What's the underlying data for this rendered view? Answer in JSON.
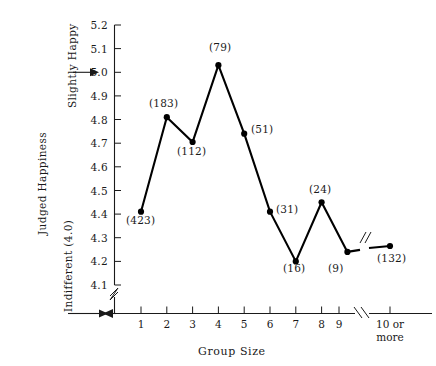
{
  "chart_data": {
    "type": "line",
    "title": "",
    "xlabel": "Group Size",
    "ylabel": "Judged Happiness",
    "categories": [
      "1",
      "2",
      "3",
      "4",
      "5",
      "6",
      "7",
      "8",
      "9",
      "10 or\nmore"
    ],
    "x_tick_labels": [
      "1",
      "2",
      "3",
      "4",
      "5",
      "6",
      "7",
      "8",
      "9",
      "10 or more"
    ],
    "x_tick_label_last_line1": "10 or",
    "x_tick_label_last_line2": "more",
    "values": [
      4.41,
      4.81,
      4.705,
      5.03,
      4.74,
      4.41,
      4.2,
      4.45,
      4.24,
      4.265
    ],
    "point_labels": [
      "(423)",
      "(183)",
      "(112)",
      "(79)",
      "(51)",
      "(31)",
      "(16)",
      "(24)",
      "(9)",
      "(132)"
    ],
    "y_tick_labels": [
      "5.2",
      "5.1",
      "5.0",
      "4.9",
      "4.8",
      "4.7",
      "4.6",
      "4.5",
      "4.4",
      "4.3",
      "4.2",
      "4.1"
    ],
    "y_tick_values": [
      5.2,
      5.1,
      5.0,
      4.9,
      4.8,
      4.7,
      4.6,
      4.5,
      4.4,
      4.3,
      4.2,
      4.1
    ],
    "ylim": [
      4.1,
      5.2
    ],
    "y_axis_break": true,
    "x_axis_break": true,
    "x_axis_break_between": [
      "9",
      "10 or more"
    ],
    "line_break_between": [
      "9",
      "10 or more"
    ],
    "grid": false,
    "legend": "none",
    "marker": "filled-circle",
    "line_color": "#000000",
    "annotations": [
      {
        "name": "slightly-happy",
        "text": "Slightly Happy",
        "points_to_y": 5.0,
        "orientation": "vertical"
      },
      {
        "name": "indifferent",
        "text": "Indifferent (4.0)",
        "points_to_y": 4.0,
        "orientation": "vertical"
      }
    ]
  },
  "axes": {
    "y_title": "Judged Happiness",
    "x_title": "Group Size",
    "y_upper_anchor_label": "Slightly Happy",
    "y_lower_anchor_label": "Indifferent (4.0)"
  }
}
